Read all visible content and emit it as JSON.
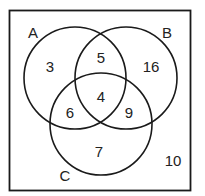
{
  "diagram": {
    "type": "venn-3-set",
    "universe_count": "10",
    "sets": [
      {
        "name": "A",
        "label": "A"
      },
      {
        "name": "B",
        "label": "B"
      },
      {
        "name": "C",
        "label": "C"
      }
    ],
    "regions": {
      "a_only": "3",
      "b_only": "16",
      "c_only": "7",
      "a_and_b_only": "5",
      "a_and_c_only": "6",
      "b_and_c_only": "9",
      "a_and_b_and_c": "4",
      "outside": "10"
    },
    "colors": {
      "stroke": "#1a1a1a",
      "background": "#ffffff",
      "text": "#222222"
    }
  }
}
